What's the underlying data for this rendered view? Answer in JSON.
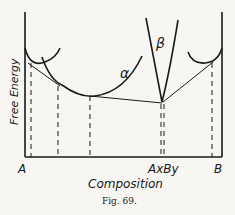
{
  "figure": {
    "caption": "Fig. 69.",
    "y_axis_label": "Free Energy",
    "x_axis_label": "Composition",
    "x_ticks": {
      "left": "A",
      "compound": "AxBy",
      "right": "B"
    },
    "curve_labels": {
      "alpha": "α",
      "beta": "β"
    },
    "line_color": "#1a1a1a",
    "background": "#f7f6f3"
  }
}
